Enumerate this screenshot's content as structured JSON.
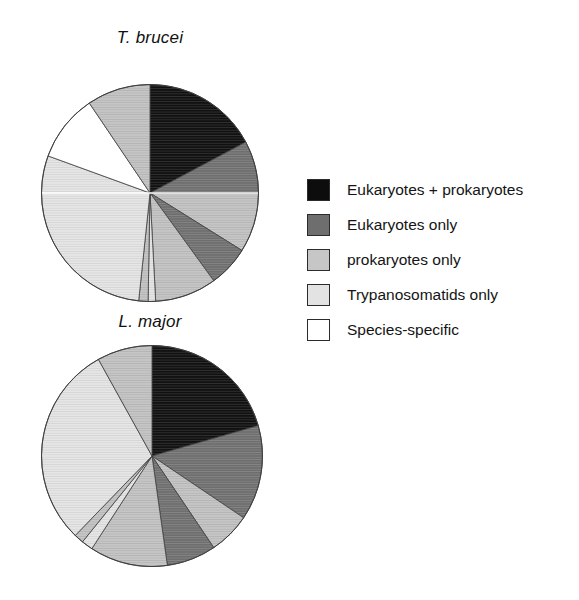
{
  "figure": {
    "background": "#ffffff",
    "charts": [
      {
        "id": "t-brucei",
        "title": "T. brucei"
      },
      {
        "id": "l-major",
        "title": "L. major"
      }
    ]
  },
  "legend": {
    "items": [
      {
        "label": "Eukaryotes + prokaryotes",
        "color": "#0d0d0d",
        "swatch_name": "legend-swatch-eukaryotes-prokaryotes"
      },
      {
        "label": "Eukaryotes only",
        "color": "#6e6e6e",
        "swatch_name": "legend-swatch-eukaryotes-only"
      },
      {
        "label": "prokaryotes only",
        "color": "#c6c6c6",
        "swatch_name": "legend-swatch-prokaryotes-only"
      },
      {
        "label": "Trypanosomatids only",
        "color": "#e3e3e3",
        "swatch_name": "legend-swatch-trypanosomatids-only"
      },
      {
        "label": "Species-specific",
        "color": "#ffffff",
        "swatch_name": "legend-swatch-species-specific"
      }
    ]
  },
  "chart_data": [
    {
      "type": "pie",
      "title": "T. brucei",
      "start_angle": 0,
      "direction": "clockwise",
      "categories": [
        "Eukaryotes + prokaryotes",
        "Eukaryotes only",
        "prokaryotes only",
        "Trypanosomatids only",
        "Species-specific"
      ],
      "colors": [
        "#0d0d0d",
        "#6e6e6e",
        "#c6c6c6",
        "#e3e3e3",
        "#ffffff"
      ],
      "slices": [
        {
          "label": "Eukaryotes + prokaryotes",
          "category": "Eukaryotes + prokaryotes",
          "color": "#0d0d0d",
          "start_deg": 0,
          "end_deg": 62,
          "percent": 17.2
        },
        {
          "label": "Eukaryotes only",
          "category": "Eukaryotes only",
          "color": "#6e6e6e",
          "start_deg": 62,
          "end_deg": 90,
          "percent": 7.8
        },
        {
          "label": "prokaryotes only",
          "category": "prokaryotes only",
          "color": "#c6c6c6",
          "start_deg": 90,
          "end_deg": 122,
          "percent": 8.9
        },
        {
          "label": "Eukaryotes only",
          "category": "Eukaryotes only",
          "color": "#6e6e6e",
          "start_deg": 122,
          "end_deg": 144,
          "percent": 6.1
        },
        {
          "label": "prokaryotes only",
          "category": "prokaryotes only",
          "color": "#c6c6c6",
          "start_deg": 144,
          "end_deg": 177,
          "percent": 9.2
        },
        {
          "label": "Trypanosomatids only",
          "category": "Trypanosomatids only",
          "color": "#e3e3e3",
          "start_deg": 177,
          "end_deg": 181,
          "percent": 1.1
        },
        {
          "label": "prokaryotes only",
          "category": "prokaryotes only",
          "color": "#c6c6c6",
          "start_deg": 181,
          "end_deg": 186,
          "percent": 1.4
        },
        {
          "label": "Trypanosomatids only",
          "category": "Trypanosomatids only",
          "color": "#e3e3e3",
          "start_deg": 186,
          "end_deg": 290,
          "percent": 28.9
        },
        {
          "label": "Species-specific",
          "category": "Species-specific",
          "color": "#ffffff",
          "start_deg": 290,
          "end_deg": 326,
          "percent": 10.0
        },
        {
          "label": "prokaryotes only",
          "category": "prokaryotes only",
          "color": "#c6c6c6",
          "start_deg": 326,
          "end_deg": 360,
          "percent": 9.4
        }
      ]
    },
    {
      "type": "pie",
      "title": "L. major",
      "start_angle": 0,
      "direction": "clockwise",
      "categories": [
        "Eukaryotes + prokaryotes",
        "Eukaryotes only",
        "prokaryotes only",
        "Trypanosomatids only",
        "Species-specific"
      ],
      "colors": [
        "#0d0d0d",
        "#6e6e6e",
        "#c6c6c6",
        "#e3e3e3",
        "#ffffff"
      ],
      "slices": [
        {
          "label": "Eukaryotes + prokaryotes",
          "category": "Eukaryotes + prokaryotes",
          "color": "#0d0d0d",
          "start_deg": 0,
          "end_deg": 74,
          "percent": 20.6
        },
        {
          "label": "Eukaryotes only",
          "category": "Eukaryotes only",
          "color": "#6e6e6e",
          "start_deg": 74,
          "end_deg": 124,
          "percent": 13.9
        },
        {
          "label": "prokaryotes only",
          "category": "prokaryotes only",
          "color": "#c6c6c6",
          "start_deg": 124,
          "end_deg": 146,
          "percent": 6.1
        },
        {
          "label": "Eukaryotes only",
          "category": "Eukaryotes only",
          "color": "#6e6e6e",
          "start_deg": 146,
          "end_deg": 172,
          "percent": 7.2
        },
        {
          "label": "prokaryotes only",
          "category": "prokaryotes only",
          "color": "#c6c6c6",
          "start_deg": 172,
          "end_deg": 213,
          "percent": 11.4
        },
        {
          "label": "Trypanosomatids only",
          "category": "Trypanosomatids only",
          "color": "#e3e3e3",
          "start_deg": 213,
          "end_deg": 219,
          "percent": 1.7
        },
        {
          "label": "prokaryotes only",
          "category": "prokaryotes only",
          "color": "#c6c6c6",
          "start_deg": 219,
          "end_deg": 224,
          "percent": 1.4
        },
        {
          "label": "Trypanosomatids only",
          "category": "Trypanosomatids only",
          "color": "#e3e3e3",
          "start_deg": 224,
          "end_deg": 331,
          "percent": 29.7
        },
        {
          "label": "prokaryotes only",
          "category": "prokaryotes only",
          "color": "#c6c6c6",
          "start_deg": 331,
          "end_deg": 360,
          "percent": 8.0
        }
      ]
    }
  ]
}
